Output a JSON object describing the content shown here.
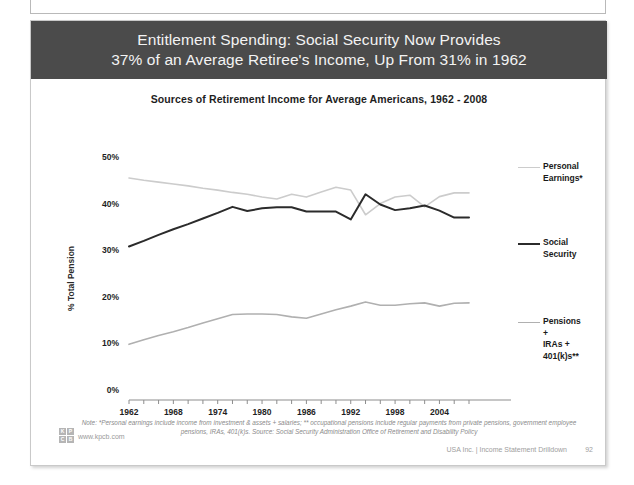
{
  "slide": {
    "headline_line1": "Entitlement Spending: Social Security Now Provides",
    "headline_line2": "37% of an Average Retiree's Income, Up From 31% in 1962",
    "headline_bg": "#4b4b4b",
    "note": "Note: *Personal earnings include income from investment & assets + salaries; ** occupational pensions include regular payments from private pensions, government employee pensions, IRAs, 401(k)s. Source: Social Security Administration Office of Retirement and Disability Policy",
    "kpcb_url": "www.kpcb.com",
    "logo_letters": [
      "K",
      "P",
      "C",
      "B"
    ],
    "footer_right": "USA Inc. | Income Statement Drilldown",
    "page_number": "92"
  },
  "chart_data": {
    "type": "line",
    "title": "Sources of Retirement Income for Average Americans, 1962 - 2008",
    "xlabel": "",
    "ylabel": "% Total Pension",
    "ylim": [
      0,
      50
    ],
    "yticks": [
      "0%",
      "10%",
      "20%",
      "30%",
      "40%",
      "50%"
    ],
    "ytick_values": [
      0,
      10,
      20,
      30,
      40,
      50
    ],
    "xlim": [
      1962,
      2008
    ],
    "xticks": [
      "1962",
      "1968",
      "1974",
      "1980",
      "1986",
      "1992",
      "1998",
      "2004"
    ],
    "xtick_values": [
      1962,
      1968,
      1974,
      1980,
      1986,
      1992,
      1998,
      2004
    ],
    "minor_tick_interval": 2,
    "grid": false,
    "legend_position": "right",
    "x": [
      1962,
      1964,
      1966,
      1968,
      1970,
      1972,
      1974,
      1976,
      1978,
      1980,
      1982,
      1984,
      1986,
      1988,
      1990,
      1992,
      1994,
      1996,
      1998,
      2000,
      2002,
      2004,
      2006,
      2008
    ],
    "series": [
      {
        "name": "Personal Earnings*",
        "label": "Personal\nEarnings*",
        "color": "#cccccc",
        "width": 1.6,
        "values": [
          45.5,
          45.0,
          44.6,
          44.2,
          43.8,
          43.3,
          42.9,
          42.4,
          42.0,
          41.4,
          41.0,
          42.0,
          41.4,
          42.5,
          43.5,
          42.9,
          37.6,
          40.0,
          41.4,
          41.8,
          39.3,
          41.5,
          42.3,
          42.3
        ]
      },
      {
        "name": "Social Security",
        "label": "Social\nSecurity",
        "color": "#2b2b2b",
        "width": 2.0,
        "values": [
          30.8,
          32.0,
          33.3,
          34.5,
          35.6,
          36.8,
          38.0,
          39.3,
          38.4,
          39.0,
          39.2,
          39.2,
          38.3,
          38.3,
          38.3,
          36.6,
          42.0,
          39.8,
          38.6,
          39.0,
          39.6,
          38.5,
          37.0,
          37.0
        ]
      },
      {
        "name": "Pensions + IRAs + 401(k)s**",
        "label": "Pensions +\nIRAs +\n401(k)s**",
        "color": "#b0b0b0",
        "width": 1.6,
        "values": [
          9.8,
          10.8,
          11.7,
          12.5,
          13.4,
          14.4,
          15.3,
          16.2,
          16.3,
          16.3,
          16.2,
          15.7,
          15.4,
          16.3,
          17.2,
          18.0,
          18.9,
          18.2,
          18.2,
          18.5,
          18.7,
          18.0,
          18.6,
          18.7
        ]
      }
    ]
  }
}
